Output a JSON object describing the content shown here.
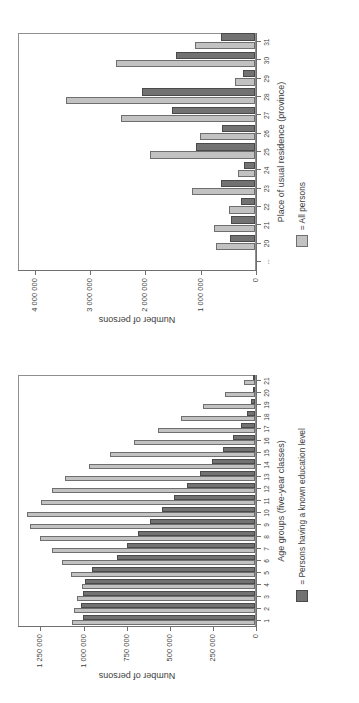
{
  "document": {
    "kind": "scanned-figure-page",
    "orientation": "rotated-90-ccw",
    "background_color": "#ffffff",
    "ink_color": "#3d3d3d"
  },
  "palette": {
    "bar_light": "#c2c2c2",
    "bar_dark": "#727272",
    "bar_outline": "#6f6f6f",
    "frame": "#8f8f8f"
  },
  "chart_data": [
    {
      "id": "age-groups-chart",
      "type": "bar",
      "title": "",
      "xlabel": "Age groups (five-year classes)",
      "ylabel": "Number of persons",
      "ylim": [
        0,
        1380000
      ],
      "yticks": [
        0,
        250000,
        500000,
        750000,
        1000000,
        1250000
      ],
      "ytick_labels": [
        "0",
        "250 000",
        "500 000",
        "750 000",
        "1 000 000",
        "1 250 000"
      ],
      "grid": false,
      "legend_position": "below-right",
      "categories": [
        "1",
        "2",
        "3",
        "4",
        "5",
        "6",
        "7",
        "8",
        "9",
        "10",
        "11",
        "12",
        "13",
        "14",
        "15",
        "16",
        "17",
        "18",
        "19",
        "20",
        "21"
      ],
      "series": [
        {
          "name": "All persons",
          "color": "#c2c2c2",
          "values": [
            1060000,
            1050000,
            1030000,
            1005000,
            1065000,
            1120000,
            1180000,
            1245000,
            1305000,
            1320000,
            1240000,
            1175000,
            1100000,
            965000,
            840000,
            700000,
            565000,
            430000,
            300000,
            175000,
            65000
          ]
        },
        {
          "name": "Persons having a known education level",
          "color": "#727272",
          "values": [
            995000,
            1010000,
            1000000,
            985000,
            945000,
            800000,
            740000,
            680000,
            610000,
            540000,
            470000,
            395000,
            320000,
            250000,
            185000,
            125000,
            80000,
            45000,
            22000,
            9000,
            3000
          ]
        }
      ],
      "legend_entries": [
        {
          "label": "= Persons having a known education level",
          "swatch": "dark"
        }
      ]
    },
    {
      "id": "province-chart",
      "type": "bar",
      "title": "",
      "xlabel": "Place of usual residence (province)",
      "ylabel": "Number of persons",
      "ylim": [
        0,
        4300000
      ],
      "yticks": [
        0,
        1000000,
        2000000,
        3000000,
        4000000
      ],
      "ytick_labels": [
        "0",
        "1 000 000",
        "2 000 000",
        "3 000 000",
        "4 000 000"
      ],
      "grid": false,
      "legend_position": "below-right",
      "categories": [
        "...",
        "20",
        "21",
        "22",
        "23",
        "24",
        "25",
        "26",
        "27",
        "28",
        "29",
        "30",
        "31"
      ],
      "series": [
        {
          "name": "All persons",
          "color": "#c2c2c2",
          "values": [
            0,
            700000,
            740000,
            470000,
            1130000,
            300000,
            1900000,
            1000000,
            2430000,
            3410000,
            360000,
            2510000,
            1080000
          ]
        },
        {
          "name": "Persons having a known education level",
          "color": "#727272",
          "values": [
            0,
            455000,
            430000,
            250000,
            610000,
            200000,
            1060000,
            590000,
            1500000,
            2050000,
            220000,
            1420000,
            620000
          ]
        }
      ],
      "legend_entries": [
        {
          "label": "= All persons",
          "swatch": "light"
        }
      ]
    }
  ],
  "charts": {
    "left": {
      "axis_title_x": "Age groups (five-year classes)",
      "axis_title_y": "Number of persons",
      "legend_label": "= Persons having a known education level"
    },
    "right": {
      "axis_title_x": "Place of usual residence (province)",
      "axis_title_y": "Number of persons",
      "legend_label": "= All persons"
    }
  }
}
